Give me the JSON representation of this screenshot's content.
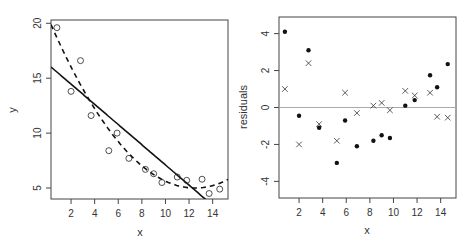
{
  "chart_data": [
    {
      "type": "scatter",
      "panel": "left",
      "title": "",
      "xlabel": "x",
      "ylabel": "y",
      "xlim": [
        0.3,
        15.3
      ],
      "ylim": [
        4.0,
        20.3
      ],
      "xticks": [
        2,
        4,
        6,
        8,
        10,
        12,
        14
      ],
      "yticks": [
        5,
        10,
        15,
        20
      ],
      "grid": false,
      "series": [
        {
          "name": "observations",
          "marker": "open-circle",
          "x": [
            0.8,
            2.0,
            2.8,
            3.7,
            5.2,
            5.9,
            6.9,
            8.3,
            9.0,
            9.7,
            11.0,
            11.8,
            13.1,
            13.7,
            14.6
          ],
          "y": [
            19.6,
            13.8,
            16.6,
            11.6,
            8.4,
            10.0,
            7.7,
            6.7,
            6.3,
            5.5,
            6.0,
            5.7,
            5.8,
            4.5,
            4.9
          ]
        },
        {
          "name": "linear fit",
          "style": "solid-line",
          "equation": "y = 16.3 - 0.92x"
        },
        {
          "name": "quadratic fit",
          "style": "dashed-line",
          "equation": "y = 0.1(x - 12.5)^2 + 5"
        }
      ]
    },
    {
      "type": "scatter",
      "panel": "right",
      "title": "",
      "xlabel": "x",
      "ylabel": "residuals",
      "xlim": [
        0.3,
        15.3
      ],
      "ylim": [
        -4.9,
        4.9
      ],
      "xticks": [
        2,
        4,
        6,
        8,
        10,
        12,
        14
      ],
      "yticks": [
        -4,
        -2,
        0,
        2,
        4
      ],
      "grid": false,
      "reference_line": 0,
      "series": [
        {
          "name": "linear fit residuals",
          "marker": "filled-dot",
          "x": [
            0.8,
            2.0,
            2.8,
            3.7,
            5.2,
            5.9,
            6.9,
            8.3,
            9.0,
            9.7,
            11.0,
            11.8,
            13.1,
            13.7,
            14.6
          ],
          "y": [
            4.1,
            -0.45,
            3.1,
            -1.1,
            -3.0,
            -0.7,
            -2.1,
            -1.8,
            -1.5,
            -1.65,
            0.1,
            0.4,
            1.75,
            1.1,
            2.35
          ]
        },
        {
          "name": "quadratic fit residuals",
          "marker": "cross",
          "x": [
            0.8,
            2.0,
            2.8,
            3.7,
            5.2,
            5.9,
            6.9,
            8.3,
            9.0,
            9.7,
            11.0,
            11.8,
            13.1,
            13.7,
            14.6
          ],
          "y": [
            1.0,
            -2.0,
            2.4,
            -0.9,
            -1.8,
            0.8,
            -0.3,
            0.1,
            0.25,
            -0.15,
            0.9,
            0.65,
            0.8,
            -0.5,
            -0.55
          ]
        }
      ]
    }
  ],
  "colors": {
    "axis": "#444444",
    "points": "#111111",
    "reference_line": "#aaaaaa"
  }
}
